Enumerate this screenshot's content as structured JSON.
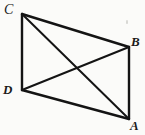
{
  "figure": {
    "type": "geometry-diagram",
    "background_color": "#fbfbf9",
    "stroke_color": "#141414",
    "label_color": "#1a1a1a",
    "canvas": {
      "width": 145,
      "height": 135
    },
    "vertices": [
      {
        "id": "C",
        "label": "C",
        "x": 22,
        "y": 14,
        "label_x": 4,
        "label_y": 3
      },
      {
        "id": "B",
        "label": "B",
        "x": 129,
        "y": 47,
        "label_x": 131,
        "label_y": 35
      },
      {
        "id": "A",
        "label": "A",
        "x": 129,
        "y": 119,
        "label_x": 130,
        "label_y": 119
      },
      {
        "id": "D",
        "label": "D",
        "x": 22,
        "y": 90,
        "label_x": 3,
        "label_y": 83
      }
    ],
    "edges": [
      {
        "name": "side-CB",
        "from": "C",
        "to": "B",
        "x1": 22,
        "y1": 14,
        "x2": 129,
        "y2": 47,
        "width": 2.4
      },
      {
        "name": "side-BA",
        "from": "B",
        "to": "A",
        "x1": 129,
        "y1": 47,
        "x2": 129,
        "y2": 119,
        "width": 2.4
      },
      {
        "name": "side-AD",
        "from": "A",
        "to": "D",
        "x1": 129,
        "y1": 119,
        "x2": 22,
        "y2": 90,
        "width": 2.4
      },
      {
        "name": "side-DC",
        "from": "D",
        "to": "C",
        "x1": 22,
        "y1": 90,
        "x2": 22,
        "y2": 14,
        "width": 2.4
      },
      {
        "name": "diagonal-CA",
        "from": "C",
        "to": "A",
        "x1": 22,
        "y1": 14,
        "x2": 129,
        "y2": 119,
        "width": 2.0
      },
      {
        "name": "diagonal-DB",
        "from": "D",
        "to": "B",
        "x1": 22,
        "y1": 90,
        "x2": 129,
        "y2": 47,
        "width": 2.0
      }
    ],
    "marks": [
      {
        "name": "scan-speck",
        "x": 126,
        "y": 20
      }
    ]
  }
}
